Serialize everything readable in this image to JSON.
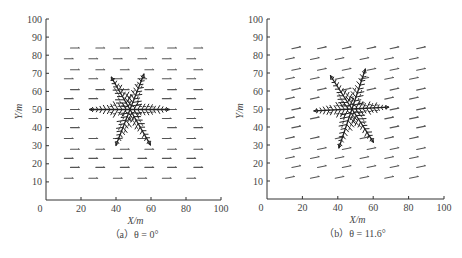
{
  "chart_data": [
    {
      "type": "scatter",
      "subtype": "vector-field with dendritic crystal",
      "title": "",
      "caption": "（a）θ = 0°",
      "caption_letter": "a",
      "theta_deg": 0,
      "xlabel": "X/m",
      "ylabel": "Y/m",
      "xlim": [
        0,
        100
      ],
      "ylim": [
        0,
        100
      ],
      "xticks": [
        0,
        20,
        40,
        60,
        80,
        100
      ],
      "yticks": [
        10,
        20,
        30,
        40,
        50,
        60,
        70,
        80,
        90,
        100
      ],
      "grid": false,
      "arrow_rows_y": [
        84,
        78,
        72,
        67,
        61,
        56,
        50,
        45,
        40,
        34,
        28,
        23,
        18,
        12
      ],
      "arrow_cols_x_even_rows": [
        16.5,
        31,
        45,
        59,
        72,
        87
      ],
      "arrow_cols_x_odd_rows": [
        13,
        27,
        41,
        55,
        69,
        83
      ],
      "arrow_angle_deg": 0,
      "arrow_length": 5,
      "crystal": {
        "center": [
          48,
          50
        ],
        "arm_length": 23,
        "branches": 6
      }
    },
    {
      "type": "scatter",
      "subtype": "vector-field with dendritic crystal",
      "title": "",
      "caption": "（b）θ = 11.6°",
      "caption_letter": "b",
      "theta_deg": 11.6,
      "xlabel": "X/m",
      "ylabel": "Y/m",
      "xlim": [
        0,
        100
      ],
      "ylim": [
        0,
        100
      ],
      "xticks": [
        0,
        20,
        40,
        60,
        80,
        100
      ],
      "yticks": [
        10,
        20,
        30,
        40,
        50,
        60,
        70,
        80,
        90,
        100
      ],
      "grid": false,
      "arrow_rows_y": [
        84,
        78,
        72,
        67,
        61,
        56,
        50,
        45,
        40,
        34,
        28,
        23,
        18,
        12
      ],
      "arrow_cols_x_even_rows": [
        16.5,
        31,
        45,
        59,
        72,
        87
      ],
      "arrow_cols_x_odd_rows": [
        13,
        27,
        41,
        55,
        69,
        83
      ],
      "arrow_angle_deg": 11.6,
      "arrow_length": 5,
      "crystal": {
        "center": [
          48,
          50
        ],
        "arm_length": 23,
        "branches": 6
      }
    }
  ],
  "panels": [
    {
      "xlabel": "X/m",
      "ylabel": "Y/m",
      "caption": "（a）θ = 0°",
      "origin_label": "0"
    },
    {
      "xlabel": "X/m",
      "ylabel": "Y/m",
      "caption": "（b）θ = 11.6°",
      "origin_label": "0"
    }
  ],
  "colors": {
    "axis": "#333333",
    "arrows": "#555555",
    "crystal": "#222222",
    "text": "#444444"
  }
}
